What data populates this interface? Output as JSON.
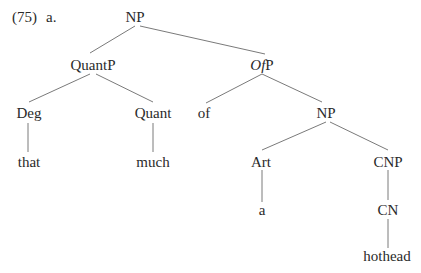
{
  "example": {
    "number": "(75)",
    "sub": "a."
  },
  "tree": {
    "nodes": [
      {
        "id": "np_root",
        "label": "NP",
        "x": 135,
        "y": 22
      },
      {
        "id": "quantp",
        "label": "QuantP",
        "x": 93,
        "y": 70
      },
      {
        "id": "ofp",
        "label_italic": "Of",
        "label_rest": "P",
        "x": 262,
        "y": 70
      },
      {
        "id": "deg",
        "label": "Deg",
        "x": 29,
        "y": 118
      },
      {
        "id": "quant",
        "label": "Quant",
        "x": 153,
        "y": 118
      },
      {
        "id": "of",
        "label": "of",
        "x": 204,
        "y": 118
      },
      {
        "id": "np2",
        "label": "NP",
        "x": 326,
        "y": 118
      },
      {
        "id": "that",
        "label": "that",
        "x": 29,
        "y": 167
      },
      {
        "id": "much",
        "label": "much",
        "x": 153,
        "y": 167
      },
      {
        "id": "art",
        "label": "Art",
        "x": 261,
        "y": 167
      },
      {
        "id": "cnp",
        "label": "CNP",
        "x": 388,
        "y": 167
      },
      {
        "id": "a",
        "label": "a",
        "x": 262,
        "y": 215
      },
      {
        "id": "cn",
        "label": "CN",
        "x": 388,
        "y": 215
      },
      {
        "id": "hothead",
        "label": "hothead",
        "x": 387,
        "y": 261
      }
    ],
    "edges": [
      [
        "np_root",
        "quantp"
      ],
      [
        "np_root",
        "ofp"
      ],
      [
        "quantp",
        "deg"
      ],
      [
        "quantp",
        "quant"
      ],
      [
        "ofp",
        "of"
      ],
      [
        "ofp",
        "np2"
      ],
      [
        "deg",
        "that"
      ],
      [
        "quant",
        "much"
      ],
      [
        "np2",
        "art"
      ],
      [
        "np2",
        "cnp"
      ],
      [
        "art",
        "a"
      ],
      [
        "cnp",
        "cn"
      ],
      [
        "cn",
        "hothead"
      ]
    ]
  }
}
